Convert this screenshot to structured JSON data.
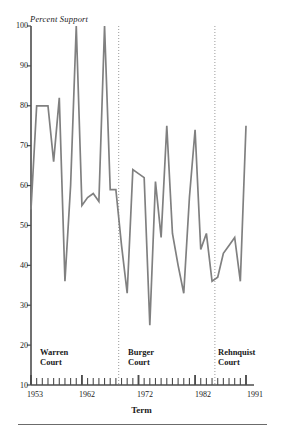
{
  "chart_data": {
    "type": "line",
    "title": "",
    "ylabel": "Percent Support",
    "xlabel": "Term",
    "ylim": [
      10,
      100
    ],
    "yticks": [
      10,
      20,
      30,
      40,
      50,
      60,
      70,
      80,
      90,
      100
    ],
    "xlim": [
      1953,
      1991
    ],
    "xticks": [
      1953,
      1962,
      1972,
      1982,
      1991
    ],
    "grid": false,
    "legend": null,
    "line_color": "#808080",
    "x": [
      1953,
      1954,
      1955,
      1956,
      1957,
      1958,
      1959,
      1960,
      1961,
      1962,
      1963,
      1964,
      1965,
      1966,
      1967,
      1968,
      1969,
      1970,
      1971,
      1972,
      1973,
      1974,
      1975,
      1976,
      1977,
      1978,
      1979,
      1980,
      1981,
      1982,
      1983,
      1984,
      1985,
      1986,
      1987,
      1988,
      1989,
      1990,
      1991
    ],
    "values": [
      54,
      80,
      80,
      80,
      66,
      82,
      36,
      60,
      100,
      55,
      57,
      58,
      56,
      100,
      59,
      59,
      45,
      33,
      64,
      63,
      62,
      25,
      61,
      47,
      75,
      48,
      40,
      33,
      57,
      74,
      44,
      48,
      36,
      37,
      43,
      45,
      47,
      36,
      75
    ],
    "annotations": [
      {
        "label": "Warren Court",
        "x": 1953
      },
      {
        "label": "Burger Court",
        "x": 1969
      },
      {
        "label": "Rehnquist Court",
        "x": 1986
      }
    ],
    "dividers": [
      1968.5,
      1985.5
    ]
  },
  "axis": {
    "y_label": "Percent Support",
    "x_label": "Term",
    "y_ticks": [
      "100",
      "90",
      "80",
      "70",
      "60",
      "50",
      "40",
      "30",
      "20",
      "10"
    ],
    "x_ticks": [
      "1953",
      "1962",
      "1972",
      "1982",
      "1991"
    ]
  },
  "eras": [
    {
      "line1": "Warren",
      "line2": "Court"
    },
    {
      "line1": "Burger",
      "line2": "Court"
    },
    {
      "line1": "Rehnquist",
      "line2": "Court"
    }
  ],
  "colors": {
    "line": "#808080",
    "axis": "#4d4d4d",
    "divider": "#9a9a9a",
    "text": "#1a1a1a"
  }
}
